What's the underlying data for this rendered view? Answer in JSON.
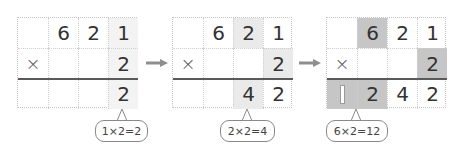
{
  "diagram": {
    "colors": {
      "grid_line": "#c4c4c4",
      "rule_line": "#5a5a5a",
      "highlight_light": "#eaeaea",
      "highlight_dark": "#c6c6c6",
      "arrow": "#8e8e8e",
      "text": "#333333"
    },
    "arrows": [
      {
        "icon": "right-arrow-icon"
      },
      {
        "icon": "right-arrow-icon"
      }
    ],
    "panels": [
      {
        "step": 1,
        "rows": [
          [
            "",
            "6",
            "2",
            "1"
          ],
          [
            "×",
            "",
            "",
            "2"
          ],
          [
            "",
            "",
            "",
            "2"
          ]
        ],
        "bubble": "1×2=2"
      },
      {
        "step": 2,
        "rows": [
          [
            "",
            "6",
            "2",
            "1"
          ],
          [
            "×",
            "",
            "",
            "2"
          ],
          [
            "",
            "",
            "4",
            "2"
          ]
        ],
        "bubble": "2×2=4"
      },
      {
        "step": 3,
        "rows": [
          [
            "",
            "6",
            "2",
            "1"
          ],
          [
            "×",
            "",
            "",
            "2"
          ],
          [
            "1",
            "2",
            "4",
            "2"
          ]
        ],
        "bubble": "6×2=12"
      }
    ]
  }
}
